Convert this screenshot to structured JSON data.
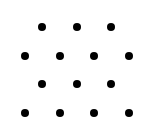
{
  "diagram": {
    "type": "dot-grid",
    "dot_color": "#000000",
    "background": "#ffffff",
    "dot_diameter": 8,
    "rows": [
      {
        "y": 27,
        "x": [
          42,
          77,
          111
        ]
      },
      {
        "y": 56,
        "x": [
          25,
          60,
          94,
          129
        ]
      },
      {
        "y": 84,
        "x": [
          42,
          77,
          111
        ]
      },
      {
        "y": 113,
        "x": [
          25,
          60,
          94,
          129
        ]
      }
    ],
    "total_dots": 14
  }
}
